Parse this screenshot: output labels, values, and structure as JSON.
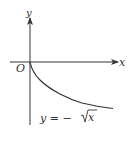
{
  "diagram": {
    "axes": {
      "x_label": "x",
      "y_label": "y",
      "origin_label": "O"
    },
    "curve": {
      "equation_label_prefix": "y = −",
      "equation_label_radicand": "x",
      "function": "y = -sqrt(x)"
    },
    "colors": {
      "stroke": "#333333",
      "background": "#ffffff"
    }
  }
}
